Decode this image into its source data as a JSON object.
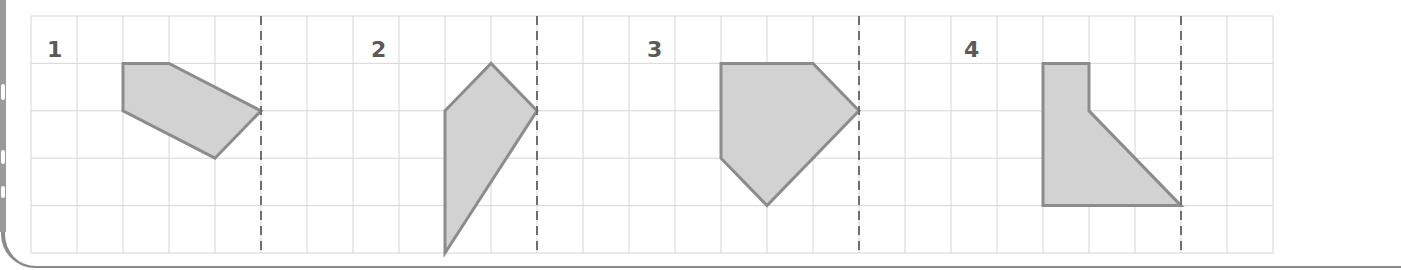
{
  "worksheet": {
    "grid": {
      "origin_x": 31,
      "origin_y": 16,
      "cell_w": 46,
      "cell_h": 47.4,
      "cols": 27,
      "rows": 5,
      "line_color": "#d6d6d6"
    },
    "colors": {
      "shape_fill": "#d2d2d2",
      "shape_stroke": "#8c8c8c",
      "axis_color": "#6e6e6e",
      "label_color": "#5a5a5a",
      "frame_color": "#8a8a8a"
    },
    "exercises": [
      {
        "label": "1",
        "label_x": 47,
        "mirror_col": 5,
        "vertices": [
          [
            2,
            1
          ],
          [
            3,
            1
          ],
          [
            5,
            2
          ],
          [
            4,
            3
          ],
          [
            2,
            2
          ]
        ]
      },
      {
        "label": "2",
        "label_x": 371,
        "mirror_col": 11,
        "vertices": [
          [
            10,
            1
          ],
          [
            11,
            2
          ],
          [
            9,
            5
          ],
          [
            9,
            2
          ]
        ]
      },
      {
        "label": "3",
        "label_x": 647,
        "mirror_col": 18,
        "vertices": [
          [
            15,
            1
          ],
          [
            17,
            1
          ],
          [
            18,
            2
          ],
          [
            16,
            4
          ],
          [
            15,
            3
          ]
        ]
      },
      {
        "label": "4",
        "label_x": 964,
        "mirror_col": 25,
        "vertices": [
          [
            22,
            1
          ],
          [
            23,
            1
          ],
          [
            23,
            2
          ],
          [
            25,
            4
          ],
          [
            22,
            4
          ]
        ]
      }
    ]
  }
}
